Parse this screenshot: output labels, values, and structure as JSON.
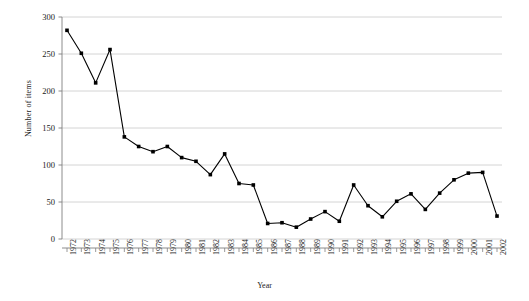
{
  "chart_data": {
    "type": "line",
    "title": "",
    "xlabel": "Year",
    "ylabel": "Number of items",
    "ylim": [
      0,
      300
    ],
    "y_ticks": [
      0,
      50,
      100,
      150,
      200,
      250,
      300
    ],
    "grid": true,
    "legend": "none",
    "marker": "square",
    "line_color": "#000000",
    "marker_color": "#000000",
    "grid_color": "#c9c9c9",
    "categories": [
      "1972",
      "1973",
      "1974",
      "1975",
      "1976",
      "1977",
      "1978",
      "1979",
      "1980",
      "1981",
      "1982",
      "1983",
      "1984",
      "1985",
      "1986",
      "1987",
      "1988",
      "1989",
      "1990",
      "1991",
      "1992",
      "1993",
      "1994",
      "1995",
      "1996",
      "1997",
      "1998",
      "1999",
      "2000",
      "2001",
      "2002"
    ],
    "values": [
      282,
      251,
      211,
      256,
      138,
      125,
      118,
      125,
      110,
      105,
      87,
      115,
      75,
      73,
      21,
      22,
      16,
      27,
      37,
      24,
      73,
      45,
      30,
      51,
      61,
      40,
      62,
      80,
      89,
      90,
      31
    ],
    "series": [
      {
        "name": "Number of items",
        "values": [
          282,
          251,
          211,
          256,
          138,
          125,
          118,
          125,
          110,
          105,
          87,
          115,
          75,
          73,
          21,
          22,
          16,
          27,
          37,
          24,
          73,
          45,
          30,
          51,
          61,
          40,
          62,
          80,
          89,
          90,
          31
        ]
      }
    ]
  },
  "axes": {
    "y_title": "Number of items",
    "x_title": "Year"
  }
}
